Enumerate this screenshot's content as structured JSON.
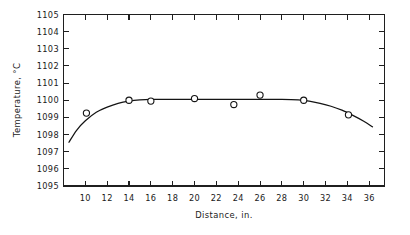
{
  "chart_data": {
    "type": "line",
    "title": "",
    "subtitle": "",
    "xlabel": "Distance, in.",
    "ylabel": "Temperature, °C",
    "xlim": [
      8,
      37.4
    ],
    "ylim": [
      1095,
      1105
    ],
    "grid": false,
    "legend": null,
    "legend_position": "none",
    "xticks": [
      10,
      12,
      14,
      16,
      18,
      20,
      22,
      24,
      26,
      28,
      30,
      32,
      34,
      36
    ],
    "xtick_labels": [
      "10",
      "12",
      "14",
      "16",
      "18",
      "20",
      "22",
      "24",
      "26",
      "28",
      "30",
      "32",
      "34",
      "36"
    ],
    "yticks": [
      1095,
      1096,
      1097,
      1098,
      1099,
      1100,
      1101,
      1102,
      1103,
      1104,
      1105
    ],
    "ytick_labels": [
      "1095",
      "1096",
      "1097",
      "1098",
      "1099",
      "1100",
      "1101",
      "1102",
      "1103",
      "1104",
      "1105"
    ],
    "tick_direction": "in",
    "frame": "full-box",
    "series": [
      {
        "name": "measured-points",
        "type": "scatter",
        "marker": "open-circle",
        "x": [
          10.1,
          14.0,
          16.0,
          20.0,
          23.6,
          26.0,
          30.0,
          34.1
        ],
        "y": [
          1099.25,
          1100.0,
          1099.95,
          1100.1,
          1099.75,
          1100.3,
          1100.0,
          1099.15
        ]
      },
      {
        "name": "fitted-curve",
        "type": "line",
        "x": [
          8.5,
          9.2,
          10.0,
          11.0,
          12.0,
          13.0,
          14.0,
          15.0,
          16.0,
          18.0,
          20.0,
          22.0,
          24.0,
          26.0,
          28.0,
          29.5,
          30.5,
          31.5,
          32.5,
          33.5,
          34.5,
          35.5,
          36.3
        ],
        "y": [
          1097.55,
          1098.25,
          1098.8,
          1099.3,
          1099.6,
          1099.82,
          1099.95,
          1100.02,
          1100.05,
          1100.05,
          1100.05,
          1100.05,
          1100.05,
          1100.05,
          1100.05,
          1100.02,
          1099.95,
          1099.82,
          1099.65,
          1099.42,
          1099.12,
          1098.78,
          1098.45
        ]
      }
    ]
  }
}
